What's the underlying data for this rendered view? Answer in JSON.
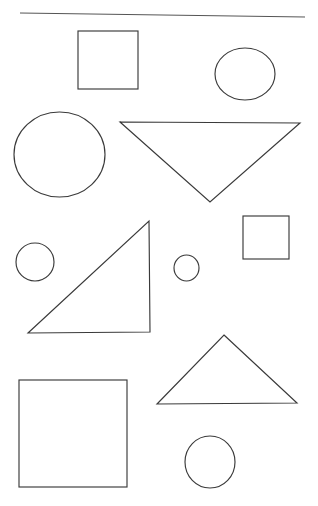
{
  "page": {
    "background_color": "#ffffff",
    "width": 318,
    "height": 506,
    "stroke_color": "#3a3a3a",
    "rule_color": "#555555",
    "fill": "none"
  },
  "shapes": [
    {
      "id": "top-rule",
      "name": "horizontal-rule",
      "kind": "line",
      "points": "20,13 305,17",
      "stroke_color": "#555555",
      "label": "Horizontal rule"
    },
    {
      "id": "square-top-left",
      "name": "square",
      "kind": "rect",
      "x": 78,
      "y": 31,
      "width": 60,
      "height": 58,
      "stroke_color": "#3a3a3a",
      "label": "Square"
    },
    {
      "id": "circle-top-right",
      "name": "circle",
      "kind": "ellipse",
      "cx": 245,
      "cy": 74,
      "rx": 30,
      "ry": 26,
      "stroke_color": "#3a3a3a",
      "label": "Circle"
    },
    {
      "id": "circle-large-left",
      "name": "circle",
      "kind": "ellipse",
      "cx": 59.5,
      "cy": 154.5,
      "rx": 45.5,
      "ry": 42.5,
      "stroke_color": "#3a3a3a",
      "label": "Large circle"
    },
    {
      "id": "triangle-inverted",
      "name": "triangle-inverted",
      "kind": "polygon",
      "points": "120,122 300,123 210,202",
      "stroke_color": "#3a3a3a",
      "label": "Inverted triangle"
    },
    {
      "id": "circle-small-left",
      "name": "circle",
      "kind": "ellipse",
      "cx": 35,
      "cy": 262,
      "rx": 19,
      "ry": 19,
      "stroke_color": "#3a3a3a",
      "label": "Small circle"
    },
    {
      "id": "triangle-right-angle",
      "name": "triangle-right",
      "kind": "polygon",
      "points": "149,221 150,332 28,333",
      "stroke_color": "#3a3a3a",
      "label": "Right triangle"
    },
    {
      "id": "circle-small-center",
      "name": "circle",
      "kind": "ellipse",
      "cx": 186.5,
      "cy": 268,
      "rx": 12.5,
      "ry": 13,
      "stroke_color": "#3a3a3a",
      "label": "Small circle"
    },
    {
      "id": "square-small-right",
      "name": "square",
      "kind": "rect",
      "x": 243,
      "y": 216,
      "width": 46,
      "height": 43,
      "stroke_color": "#3a3a3a",
      "label": "Small square"
    },
    {
      "id": "triangle-upright",
      "name": "triangle-upright",
      "kind": "polygon",
      "points": "224,335 297,403 157,404",
      "stroke_color": "#3a3a3a",
      "label": "Upright triangle"
    },
    {
      "id": "square-bottom-left",
      "name": "square",
      "kind": "rect",
      "x": 19,
      "y": 380,
      "width": 108,
      "height": 107,
      "stroke_color": "#3a3a3a",
      "label": "Large square"
    },
    {
      "id": "circle-bottom-center",
      "name": "circle",
      "kind": "ellipse",
      "cx": 210,
      "cy": 462,
      "rx": 25,
      "ry": 26,
      "stroke_color": "#3a3a3a",
      "label": "Circle"
    }
  ],
  "counts": {
    "total_shapes": 10,
    "circles": 5,
    "squares": 3,
    "triangles": 3,
    "lines": 1
  }
}
